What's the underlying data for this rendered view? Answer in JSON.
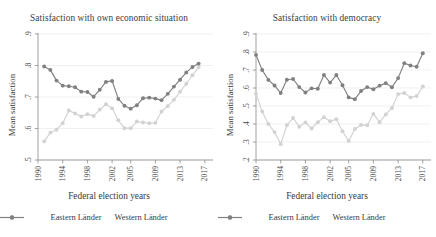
{
  "figure": {
    "xlabel": "Federal election years",
    "ylabel": "Mean satisfaction",
    "legend": [
      {
        "label": "Eastern Länder",
        "color": "#d2d2d2",
        "icon": "line-marker-icon"
      },
      {
        "label": "Western Länder",
        "color": "#808080",
        "icon": "line-marker-icon"
      }
    ]
  },
  "chart_data": [
    {
      "type": "line",
      "title": "Satisfaction with own economic situation",
      "xlabel": "Federal election years",
      "ylabel": "Mean satisfaction",
      "grid": true,
      "legend_position": "bottom",
      "xlim": [
        1990,
        2018
      ],
      "ylim": [
        0.5,
        0.9
      ],
      "yticks": [
        0.5,
        0.6,
        0.7,
        0.8,
        0.9
      ],
      "ytick_labels": [
        ".5",
        ".6",
        ".7",
        ".8",
        ".9"
      ],
      "xticks": [
        1990,
        1994,
        1998,
        2002,
        2005,
        2009,
        2013,
        2017
      ],
      "xtick_labels": [
        "1990",
        "1994",
        "1998",
        "2002",
        "2005",
        "2009",
        "2013",
        "2017"
      ],
      "series": [
        {
          "name": "Western Länder",
          "color": "#808080",
          "x": [
            1991,
            1992,
            1993,
            1994,
            1995,
            1996,
            1997,
            1998,
            1999,
            2000,
            2001,
            2002,
            2003,
            2004,
            2005,
            2006,
            2007,
            2008,
            2009,
            2010,
            2011,
            2012,
            2013,
            2014,
            2015,
            2016
          ],
          "values": [
            0.797,
            0.786,
            0.752,
            0.736,
            0.734,
            0.731,
            0.717,
            0.716,
            0.701,
            0.723,
            0.748,
            0.751,
            0.694,
            0.672,
            0.663,
            0.674,
            0.696,
            0.698,
            0.695,
            0.69,
            0.71,
            0.733,
            0.755,
            0.778,
            0.795,
            0.806
          ]
        },
        {
          "name": "Eastern Länder",
          "color": "#d2d2d2",
          "x": [
            1991,
            1992,
            1993,
            1994,
            1995,
            1996,
            1997,
            1998,
            1999,
            2000,
            2001,
            2002,
            2003,
            2004,
            2005,
            2006,
            2007,
            2008,
            2009,
            2010,
            2011,
            2012,
            2013,
            2014,
            2015,
            2016
          ],
          "values": [
            0.559,
            0.587,
            0.596,
            0.617,
            0.657,
            0.648,
            0.638,
            0.645,
            0.64,
            0.66,
            0.677,
            0.664,
            0.626,
            0.601,
            0.601,
            0.622,
            0.619,
            0.617,
            0.618,
            0.654,
            0.671,
            0.691,
            0.717,
            0.742,
            0.769,
            0.795
          ]
        }
      ]
    },
    {
      "type": "line",
      "title": "Satisfaction with democracy",
      "xlabel": "Federal election years",
      "ylabel": "Mean satisfaction",
      "grid": true,
      "legend_position": "bottom",
      "xlim": [
        1990,
        2018
      ],
      "ylim": [
        0.2,
        0.9
      ],
      "yticks": [
        0.2,
        0.3,
        0.4,
        0.5,
        0.6,
        0.7,
        0.8,
        0.9
      ],
      "ytick_labels": [
        ".2",
        ".3",
        ".4",
        ".5",
        ".6",
        ".7",
        ".8",
        ".9"
      ],
      "xticks": [
        1990,
        1994,
        1998,
        2002,
        2005,
        2009,
        2013,
        2017
      ],
      "xtick_labels": [
        "1990",
        "1994",
        "1998",
        "2002",
        "2005",
        "2009",
        "2013",
        "2017"
      ],
      "series": [
        {
          "name": "Western Länder",
          "color": "#808080",
          "x": [
            1990,
            1991,
            1992,
            1993,
            1994,
            1995,
            1996,
            1997,
            1998,
            1999,
            2000,
            2001,
            2002,
            2003,
            2004,
            2005,
            2006,
            2007,
            2008,
            2009,
            2010,
            2011,
            2012,
            2013,
            2014,
            2015,
            2016,
            2017
          ],
          "values": [
            0.784,
            0.7,
            0.645,
            0.614,
            0.572,
            0.646,
            0.65,
            0.605,
            0.575,
            0.598,
            0.596,
            0.672,
            0.63,
            0.672,
            0.615,
            0.548,
            0.538,
            0.583,
            0.605,
            0.593,
            0.613,
            0.627,
            0.604,
            0.655,
            0.738,
            0.725,
            0.718,
            0.793
          ]
        },
        {
          "name": "Eastern Länder",
          "color": "#d2d2d2",
          "x": [
            1990,
            1991,
            1992,
            1993,
            1994,
            1995,
            1996,
            1997,
            1998,
            1999,
            2000,
            2001,
            2002,
            2003,
            2004,
            2005,
            2006,
            2007,
            2008,
            2009,
            2010,
            2011,
            2012,
            2013,
            2014,
            2015,
            2016,
            2017
          ],
          "values": [
            0.568,
            0.47,
            0.4,
            0.355,
            0.288,
            0.393,
            0.433,
            0.385,
            0.409,
            0.375,
            0.41,
            0.438,
            0.415,
            0.427,
            0.36,
            0.306,
            0.372,
            0.395,
            0.393,
            0.456,
            0.41,
            0.453,
            0.489,
            0.566,
            0.572,
            0.548,
            0.555,
            0.608
          ]
        }
      ]
    }
  ]
}
